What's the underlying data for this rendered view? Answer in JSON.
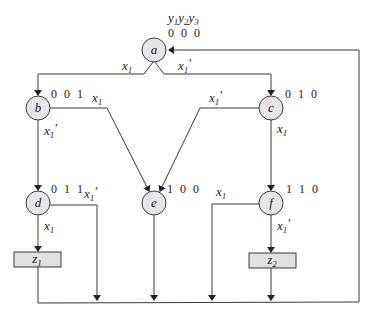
{
  "header": {
    "state_vars": [
      "y",
      "1",
      "y",
      "2",
      "y",
      "3"
    ]
  },
  "states": [
    {
      "name": "a",
      "code": "0 0 0"
    },
    {
      "name": "b",
      "code": "0 0 1"
    },
    {
      "name": "c",
      "code": "0 1 0"
    },
    {
      "name": "d",
      "code": "0 1 1"
    },
    {
      "name": "e",
      "code": "1 0 0"
    },
    {
      "name": "f",
      "code": "1 1 0"
    }
  ],
  "outputs": [
    {
      "name": "z",
      "sub": "1",
      "state": "d",
      "condition": "x1"
    },
    {
      "name": "z",
      "sub": "2",
      "state": "f",
      "condition": "x1'"
    }
  ],
  "transitions": [
    {
      "from": "a",
      "to": "b",
      "var": "x",
      "sub": "1",
      "prime": ""
    },
    {
      "from": "a",
      "to": "c",
      "var": "x",
      "sub": "1",
      "prime": "'"
    },
    {
      "from": "b",
      "to": "e",
      "var": "x",
      "sub": "1",
      "prime": ""
    },
    {
      "from": "b",
      "to": "d",
      "var": "x",
      "sub": "1",
      "prime": "'"
    },
    {
      "from": "c",
      "to": "e",
      "var": "x",
      "sub": "1",
      "prime": "'"
    },
    {
      "from": "c",
      "to": "f",
      "var": "x",
      "sub": "1",
      "prime": ""
    },
    {
      "from": "d",
      "to": "z1",
      "var": "x",
      "sub": "1",
      "prime": ""
    },
    {
      "from": "d",
      "to": "a",
      "var": "x",
      "sub": "1",
      "prime": "'"
    },
    {
      "from": "f",
      "to": "a",
      "var": "x",
      "sub": "1",
      "prime": ""
    },
    {
      "from": "f",
      "to": "z2",
      "var": "x",
      "sub": "1",
      "prime": "'"
    }
  ]
}
